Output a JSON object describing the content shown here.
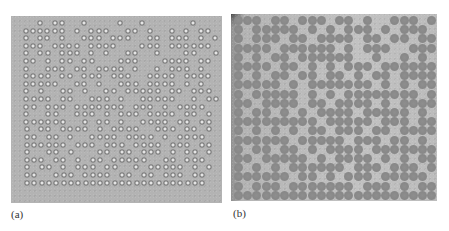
{
  "figure": {
    "panels": [
      {
        "id": "a",
        "label": "(a)",
        "description": "Microscope image of a 2D data-matrix style pattern of small ringed particles",
        "background_color": "#b3b3b3",
        "dot_color": "#7c7c7c",
        "grid": {
          "cols": 28,
          "rows": 24,
          "pitch_x": 7.3,
          "pitch_y": 7.6,
          "offset_x": 6,
          "offset_y": 4,
          "skew": -0.08
        },
        "rows": [
          "0001011001000010010000001000",
          "0111111010111001101001010110",
          "0101101001110111001101110101",
          "0111011110111100011101111110",
          "0101101110101001100100011001",
          "0110101101100011100011110110",
          "0100111011011110100101110100",
          "0111101101110111001111011110",
          "0111110011010011101111010100",
          "0101001101001101111101101110",
          "0111101100111010011111001011",
          "0110111011111110111010111100",
          "0100110011101011101111011010",
          "0111111001011010011110110110",
          "0101101111010111100111011010",
          "0110110100111101111010111100",
          "0111111011101110111101110110",
          "0100110100011011011101011010",
          "0111011010110111110011011100",
          "0101101011101100101111101010",
          "0110011101111011011011101100",
          "0111111111111111111111111100"
        ]
      },
      {
        "id": "b",
        "label": "(b)",
        "description": "Microscope image of the same pattern with larger, solid gray particles",
        "background_color": "#bdbdbd",
        "dot_color": "#888888",
        "grid": {
          "cols": 22,
          "rows": 20,
          "pitch_x": 9.2,
          "pitch_y": 9.2,
          "offset_x": 3,
          "offset_y": 2,
          "skew": 0
        },
        "rows": [
          "1110110111011010011101",
          "1011111010101110101110",
          "1011101101111011011011",
          "1111011111101011100111",
          "1010110111111001001010",
          "1111011010101110111111",
          "1010110110110101101111",
          "1111101011111110101011",
          "1011111010101111111101",
          "1101111011011110101111",
          "1011010101111011111010",
          "1111111110111110111011",
          "1010101011011101101111",
          "1111110111110111011010",
          "1011011010111101111111",
          "1101111101011110101011",
          "1010101111110111011101",
          "1111110110101110111110",
          "1011101111111011101011",
          "1111111111111111111111"
        ]
      }
    ]
  }
}
